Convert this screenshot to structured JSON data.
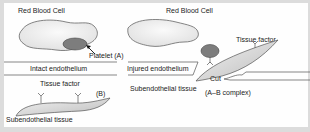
{
  "labels": {
    "rbc_left": "Red Blood Cell",
    "rbc_right": "Red Blood Cell",
    "platelet": "Platelet (A)",
    "intact": "Intact endothelium",
    "injured": "Injured endothelium",
    "tissue_factor_right": "Tissue factor",
    "cut": "Cut",
    "subendo_right": "Subendothelial tissue",
    "complex": "(A–B complex)",
    "tissue_factor_left": "Tissue factor",
    "b_label": "(B)",
    "subendo_left": "Subendothelial tissue"
  },
  "colors": {
    "background": "#dcdcdc",
    "panel": "#fefefe",
    "platelet_fill": "#7a7a7a",
    "cell_fill": "#eeeeee",
    "tissue_fill": "#d6d6d6",
    "outline": "#555555"
  }
}
